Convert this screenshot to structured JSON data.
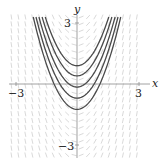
{
  "chart_data": {
    "type": "line",
    "title": "",
    "subtitle": "Slope field for dy/dx = 2x with solution curves y = x^2 + C",
    "xlabel": "x",
    "ylabel": "y",
    "xlim": [
      -3.3,
      3.5
    ],
    "ylim": [
      -3.6,
      3.6
    ],
    "grid": false,
    "legend": null,
    "x_ticks": [
      {
        "value": -3,
        "label": "−3"
      },
      {
        "value": 3,
        "label": "3"
      }
    ],
    "y_ticks": [
      {
        "value": 3,
        "label": "3"
      },
      {
        "value": -3,
        "label": "−3"
      }
    ],
    "slope_field": {
      "expression": "dy/dx = 2x",
      "x_range": [
        -3.2,
        3.2
      ],
      "y_range": [
        -3.5,
        3.5
      ],
      "spacing": 0.34,
      "color": "#c8c8c8"
    },
    "series": [
      {
        "name": "C=0.9",
        "expression": "y = x^2 + 0.9",
        "C": 0.9
      },
      {
        "name": "C=0.4",
        "expression": "y = x^2 + 0.4",
        "C": 0.4
      },
      {
        "name": "C=-0.15",
        "expression": "y = x^2 - 0.15",
        "C": -0.15
      },
      {
        "name": "C=-0.7",
        "expression": "y = x^2 - 0.7",
        "C": -0.7
      },
      {
        "name": "C=-1.25",
        "expression": "y = x^2 - 1.25",
        "C": -1.25
      }
    ],
    "curve_color": "#4a4a4a",
    "axis_color": "#8a8a8a"
  },
  "labels": {
    "x_axis": "x",
    "y_axis": "y",
    "x_tick_neg": "−3",
    "x_tick_pos": "3",
    "y_tick_pos": "3",
    "y_tick_neg": "−3"
  }
}
